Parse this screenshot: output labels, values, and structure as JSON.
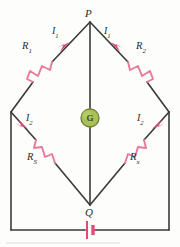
{
  "figure": {
    "type": "wheatstone-bridge-circuit-diagram",
    "colors": {
      "wire": "#3a3a3a",
      "resistor": "#e8789c",
      "arrow": "#d24b78",
      "galvanometer_fill": "#a8c05a",
      "galvanometer_stroke": "#6d8030",
      "battery": "#e24b78",
      "label_text": "#2b2b2b",
      "background": "#fdfdfb"
    },
    "nodes": [
      {
        "id": "P",
        "label": "P",
        "x": 90,
        "y": 22,
        "role": "top-junction"
      },
      {
        "id": "Q",
        "label": "Q",
        "x": 90,
        "y": 205,
        "role": "bottom-junction"
      },
      {
        "id": "L",
        "label": "",
        "x": 11,
        "y": 112,
        "role": "left-junction"
      },
      {
        "id": "R",
        "label": "",
        "x": 169,
        "y": 112,
        "role": "right-junction"
      }
    ],
    "resistors": [
      {
        "id": "R1",
        "name": "R",
        "subscript": "1",
        "branch": "P-to-left",
        "label_x": 24,
        "label_y": 47
      },
      {
        "id": "R2",
        "name": "R",
        "subscript": "2",
        "branch": "P-to-right",
        "label_x": 138,
        "label_y": 47
      },
      {
        "id": "RS",
        "name": "R",
        "subscript": "S",
        "branch": "left-to-Q",
        "label_x": 28,
        "label_y": 153
      },
      {
        "id": "Rx",
        "name": "R",
        "subscript": "x",
        "branch": "right-to-Q",
        "label_x": 131,
        "label_y": 153
      }
    ],
    "currents": [
      {
        "id": "I1-left",
        "name": "I",
        "subscript": "1",
        "label_x": 53,
        "label_y": 31,
        "direction": "toward-P"
      },
      {
        "id": "I1-right",
        "name": "I",
        "subscript": "1",
        "label_x": 105,
        "label_y": 31,
        "direction": "toward-P"
      },
      {
        "id": "I2-left",
        "name": "I",
        "subscript": "2",
        "label_x": 25,
        "label_y": 118,
        "direction": "toward-Q"
      },
      {
        "id": "I2-right",
        "name": "I",
        "subscript": "2",
        "label_x": 136,
        "label_y": 118,
        "direction": "toward-right-junction"
      }
    ],
    "galvanometer": {
      "label": "G",
      "cx": 90,
      "cy": 118,
      "r": 9
    },
    "battery": {
      "cx": 90,
      "cy": 230,
      "symbol": "cell"
    }
  }
}
